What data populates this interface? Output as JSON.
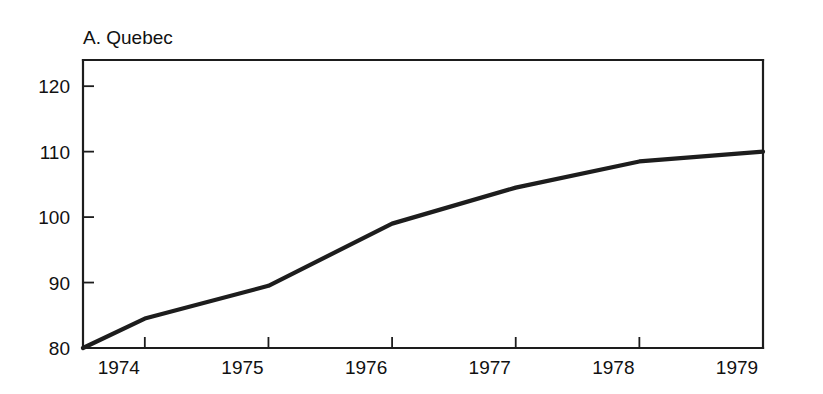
{
  "figure": {
    "title": "A. Quebec",
    "background_color": "#ffffff",
    "line_color": "#1d1d1d",
    "axis_color": "#1d1d1d"
  },
  "chart_data": {
    "type": "line",
    "title": "A. Quebec",
    "xlabel": "",
    "ylabel": "",
    "xlim": [
      1973.5,
      1979.0
    ],
    "ylim": [
      80,
      124
    ],
    "grid": false,
    "legend": null,
    "y_ticks": [
      80,
      90,
      100,
      110,
      120
    ],
    "y_tick_labels": [
      "80",
      "90",
      "100",
      "110",
      "120"
    ],
    "x_ticks": [
      1974,
      1975,
      1976,
      1977,
      1978,
      1979
    ],
    "x_tick_labels": [
      "1974",
      "1975",
      "1976",
      "1977",
      "1978",
      "1979"
    ],
    "series": [
      {
        "name": "Quebec index",
        "x": [
          1973.5,
          1974,
          1975,
          1976,
          1977,
          1978,
          1979
        ],
        "values": [
          80.0,
          84.5,
          89.5,
          99.0,
          104.5,
          108.5,
          110.0
        ]
      }
    ]
  }
}
